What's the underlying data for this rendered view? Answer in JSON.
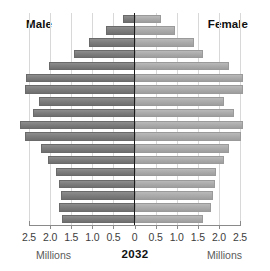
{
  "chart_data": {
    "type": "bar",
    "subtype": "population-pyramid",
    "title": "2032",
    "xlabel": "Millions",
    "ylabel": "",
    "grid": true,
    "legend_position": "top-corners",
    "axis": {
      "tick_labels": [
        "2.5",
        "2.0",
        "1.5",
        "1.0",
        "0.5",
        "0",
        "0.5",
        "1.0",
        "1.5",
        "2.0",
        "2.5"
      ],
      "tick_values": [
        -2.5,
        -2.0,
        -1.5,
        -1.0,
        -0.5,
        0,
        0.5,
        1.0,
        1.5,
        2.0,
        2.5
      ],
      "xlim": [
        -2.5,
        2.5
      ],
      "unit": "Millions"
    },
    "series": [
      {
        "name": "Male",
        "side": "left",
        "color": "#7e7e7e",
        "values": [
          0.28,
          0.67,
          1.08,
          1.43,
          2.03,
          2.57,
          2.59,
          2.27,
          2.41,
          2.72,
          2.6,
          2.21,
          2.06,
          1.87,
          1.79,
          1.75,
          1.78,
          1.72
        ]
      },
      {
        "name": "Female",
        "side": "right",
        "color": "#acacac",
        "values": [
          0.62,
          0.97,
          1.42,
          1.63,
          2.24,
          2.58,
          2.56,
          2.13,
          2.35,
          2.58,
          2.53,
          2.24,
          2.12,
          1.92,
          1.9,
          1.86,
          1.82,
          1.63
        ]
      }
    ],
    "bar_count": 18
  },
  "labels": {
    "male": "Male",
    "female": "Female",
    "year": "2032",
    "unit_left": "Millions",
    "unit_right": "Millions"
  }
}
